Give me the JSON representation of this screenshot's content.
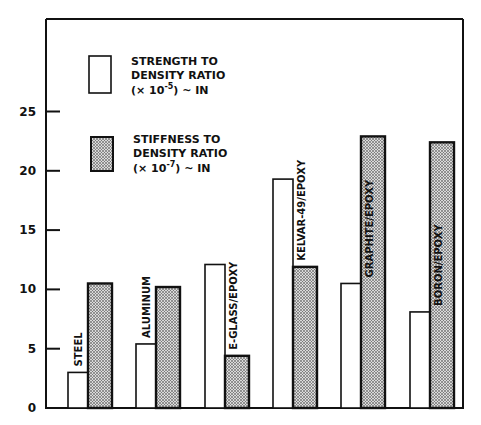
{
  "chart_data": {
    "type": "bar",
    "title": "",
    "xlabel": "",
    "ylabel": "",
    "ylim": [
      0,
      30
    ],
    "yticks": [
      0,
      5,
      10,
      15,
      20,
      25
    ],
    "grid": false,
    "legend_position": "upper-left inside",
    "categories": [
      "STEEL",
      "ALUMINUM",
      "E-GLASS/EPOXY",
      "KELVAR-49/EPOXY",
      "GRAPHITE/EPOXY",
      "BORON/EPOXY"
    ],
    "series": [
      {
        "name": "STRENGTH TO DENSITY RATIO (× 10-5) ~ IN",
        "fill": "white",
        "values": [
          3.0,
          5.4,
          12.1,
          19.3,
          10.5,
          8.1
        ]
      },
      {
        "name": "STIFFNESS TO DENSITY RATIO (× 10-7) ~ IN",
        "fill": "stippled",
        "values": [
          10.5,
          10.2,
          4.4,
          11.9,
          22.9,
          22.4
        ]
      }
    ]
  },
  "legend": {
    "strength": [
      "STRENGTH TO",
      "DENSITY RATIO",
      "(× 10",
      "-5",
      ") ~ IN"
    ],
    "stiffness": [
      "STIFFNESS TO",
      "DENSITY RATIO",
      "(× 10",
      "-7",
      ") ~ IN"
    ]
  },
  "colors": {
    "ink": "#111111",
    "background": "#ffffff",
    "stipple_dot": "#222222",
    "stipple_bg": "#d8d8d8"
  }
}
